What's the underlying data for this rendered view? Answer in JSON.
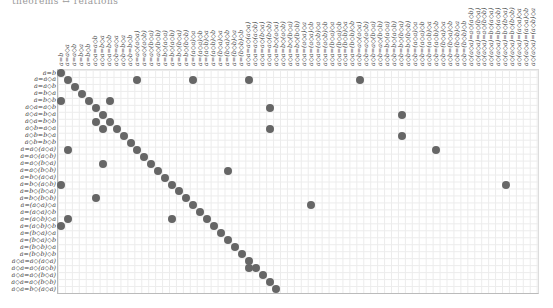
{
  "title": "theorems ↔ relations",
  "colors": {
    "dot": "#666666",
    "grid": "#ececec",
    "axis": "#bbbbbb",
    "label": "#444444"
  },
  "layout": {
    "origin_x": 61,
    "origin_y": 73,
    "cell_w": 6.95,
    "cell_h": 6.97,
    "num_cols": 69,
    "num_rows": 32
  },
  "rows": [
    "a=b",
    "a=a◇a",
    "a=a◇b",
    "a=b◇a",
    "a=b◇b",
    "a◇a=a◇b",
    "a◇a=b◇a",
    "a◇a=b◇b",
    "a◇b=a◇a",
    "a◇b=b◇a",
    "a◇b=b◇b",
    "a=a◇(a◇a)",
    "a=a◇(a◇b)",
    "a=a◇(b◇a)",
    "a=a◇(b◇b)",
    "a=b◇(a◇a)",
    "a=b◇(a◇b)",
    "a=b◇(b◇a)",
    "a=b◇(b◇b)",
    "a=(a◇a)◇a",
    "a=(a◇a)◇b",
    "a=(a◇b)◇a",
    "a=(a◇b)◇b",
    "a=(b◇a)◇a",
    "a=(b◇a)◇b",
    "a=(b◇b)◇a",
    "a=(b◇b)◇b",
    "a◇a=a◇(a◇a)",
    "a◇a=a◇(a◇b)",
    "a◇a=a◇(b◇a)",
    "a◇a=a◇(b◇b)",
    "a◇a=b◇(a◇a)"
  ],
  "columns": [
    "a=b",
    "a=a◇a",
    "a=a◇b",
    "a=b◇a",
    "a=b◇b",
    "a◇a=a◇b",
    "a◇a=b◇a",
    "a◇a=b◇b",
    "a◇b=a◇a",
    "a◇b=b◇a",
    "a◇b=b◇b",
    "a=a◇(a◇a)",
    "a=a◇(a◇b)",
    "a=a◇(b◇a)",
    "a=a◇(b◇b)",
    "a=b◇(a◇a)",
    "a=b◇(a◇b)",
    "a=b◇(b◇a)",
    "a=b◇(b◇b)",
    "a=(a◇a)◇a",
    "a=(a◇a)◇b",
    "a=(a◇b)◇a",
    "a=(a◇b)◇b",
    "a=(b◇a)◇a",
    "a=(b◇a)◇b",
    "a=(b◇b)◇a",
    "a=(b◇b)◇b",
    "a◇a=a◇(a◇a)",
    "a◇a=a◇(a◇b)",
    "a◇a=a◇(b◇a)",
    "a◇a=a◇(b◇b)",
    "a◇a=b◇(a◇a)",
    "a◇a=b◇(a◇b)",
    "a◇a=b◇(b◇a)",
    "a◇a=b◇(b◇b)",
    "a◇a=(a◇a)◇a",
    "a◇a=(a◇a)◇b",
    "a◇a=(a◇b)◇a",
    "a◇a=(a◇b)◇b",
    "a◇a=(b◇a)◇a",
    "a◇a=(b◇a)◇b",
    "a◇a=(b◇b)◇a",
    "a◇a=(b◇b)◇b",
    "a◇b=a◇(a◇a)",
    "a◇b=a◇(a◇b)",
    "a◇b=a◇(b◇a)",
    "a◇b=a◇(b◇b)",
    "a◇b=b◇(a◇a)",
    "a◇b=b◇(a◇b)",
    "a◇b=b◇(b◇a)",
    "a◇b=b◇(b◇b)",
    "a◇b=(a◇a)◇a",
    "a◇b=(a◇a)◇b",
    "a◇b=(a◇b)◇a",
    "a◇b=(a◇b)◇b",
    "a◇b=(b◇a)◇a",
    "a◇b=(b◇a)◇b",
    "a◇b=(b◇b)◇a",
    "a◇b=(b◇b)◇b",
    "a◇(a◇a)=a◇(a◇b)",
    "a◇(a◇a)=a◇(b◇a)",
    "a◇(a◇a)=a◇(b◇b)",
    "a◇(a◇a)=b◇(a◇a)",
    "a◇(a◇a)=b◇(a◇b)",
    "a◇(a◇a)=b◇(b◇a)",
    "a◇(a◇a)=b◇(b◇b)",
    "a◇(a◇a)=(a◇a)◇a",
    "a◇(a◇a)=(a◇a)◇b",
    "a◇(a◇a)=(a◇b)◇a"
  ],
  "dots": [
    [
      0,
      0
    ],
    [
      1,
      1
    ],
    [
      1,
      11
    ],
    [
      1,
      19
    ],
    [
      1,
      27
    ],
    [
      1,
      43
    ],
    [
      2,
      2
    ],
    [
      3,
      3
    ],
    [
      4,
      0
    ],
    [
      4,
      4
    ],
    [
      4,
      7
    ],
    [
      5,
      5
    ],
    [
      5,
      30
    ],
    [
      6,
      6
    ],
    [
      6,
      49
    ],
    [
      7,
      5
    ],
    [
      7,
      7
    ],
    [
      8,
      6
    ],
    [
      8,
      8
    ],
    [
      8,
      30
    ],
    [
      9,
      9
    ],
    [
      9,
      49
    ],
    [
      10,
      10
    ],
    [
      11,
      1
    ],
    [
      11,
      11
    ],
    [
      11,
      54
    ],
    [
      12,
      12
    ],
    [
      13,
      6
    ],
    [
      13,
      13
    ],
    [
      14,
      14
    ],
    [
      14,
      24
    ],
    [
      15,
      15
    ],
    [
      16,
      0
    ],
    [
      16,
      16
    ],
    [
      16,
      64
    ],
    [
      17,
      17
    ],
    [
      18,
      5
    ],
    [
      18,
      18
    ],
    [
      19,
      19
    ],
    [
      19,
      36
    ],
    [
      20,
      20
    ],
    [
      21,
      1
    ],
    [
      21,
      16
    ],
    [
      21,
      21
    ],
    [
      22,
      0
    ],
    [
      22,
      22
    ],
    [
      23,
      23
    ],
    [
      24,
      24
    ],
    [
      25,
      25
    ],
    [
      26,
      26
    ],
    [
      27,
      27
    ],
    [
      28,
      27
    ],
    [
      28,
      28
    ],
    [
      29,
      29
    ],
    [
      30,
      30
    ],
    [
      31,
      31
    ]
  ]
}
